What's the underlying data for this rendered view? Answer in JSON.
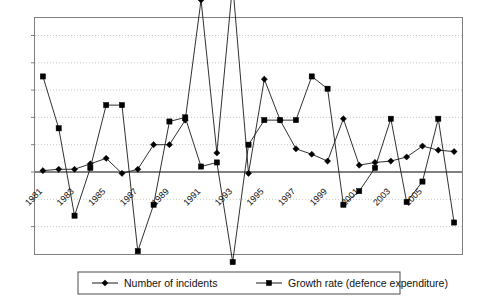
{
  "chart_data": {
    "type": "line",
    "title": "",
    "subtitle": "",
    "xlabel": "",
    "ylabel": "",
    "grid": true,
    "legend_position": "bottom",
    "x": [
      1981,
      1982,
      1983,
      1984,
      1985,
      1986,
      1987,
      1988,
      1989,
      1990,
      1991,
      1992,
      1993,
      1994,
      1995,
      1996,
      1997,
      1998,
      1999,
      2000,
      2001,
      2002,
      2003,
      2004,
      2005,
      2006,
      2007
    ],
    "xtick_labels": [
      "1981",
      "1983",
      "1985",
      "1987",
      "1989",
      "1991",
      "1993",
      "1995",
      "1997",
      "1999",
      "2001",
      "2003",
      "2005"
    ],
    "ytick_labels": [],
    "ylim": [
      -4,
      8
    ],
    "series": [
      {
        "name": "Number of incidents",
        "marker": "diamond",
        "values": [
          0.05,
          0.1,
          0.1,
          0.3,
          0.5,
          -0.05,
          0.1,
          1.0,
          1.0,
          1.9,
          6.3,
          0.7,
          6.9,
          -0.05,
          3.4,
          1.9,
          0.85,
          0.65,
          0.4,
          1.95,
          0.25,
          0.35,
          0.4,
          0.55,
          0.95,
          0.8,
          0.75
        ]
      },
      {
        "name": "Growth rate (defence expenditure)",
        "marker": "square",
        "values": [
          3.5,
          1.6,
          -1.6,
          0.15,
          2.45,
          2.45,
          -2.9,
          -1.2,
          1.85,
          2.0,
          0.2,
          0.35,
          -3.3,
          1.0,
          1.9,
          1.9,
          1.9,
          3.5,
          3.05,
          -1.2,
          -0.7,
          0.15,
          1.95,
          -1.1,
          -0.35,
          1.95,
          -1.85
        ]
      }
    ]
  },
  "legend": {
    "items": [
      {
        "label": "Number of incidents",
        "marker": "diamond"
      },
      {
        "label": "Growth rate (defence expenditure)",
        "marker": "square"
      }
    ]
  }
}
